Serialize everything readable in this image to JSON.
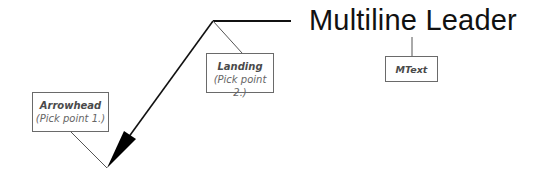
{
  "title": "Multiline Leader",
  "callouts": [
    {
      "id": "arrowhead",
      "name": "Arrowhead",
      "sub": "(Pick point 1.)"
    },
    {
      "id": "landing",
      "name": "Landing",
      "sub": "(Pick point 2.)"
    },
    {
      "id": "mtext",
      "name": "MText"
    }
  ],
  "colors": {
    "leader": "#111111",
    "callout_line": "#555555",
    "box_border": "#6a6a6a"
  }
}
